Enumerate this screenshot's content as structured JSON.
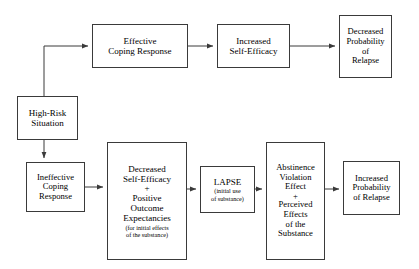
{
  "diagram": {
    "stroke_color": "#3a3a3a",
    "background": "#ffffff",
    "nodes": {
      "high_risk": {
        "lines": [
          "High-Risk",
          "Situation"
        ]
      },
      "effective_coping": {
        "lines": [
          "Effective",
          "Coping Response"
        ]
      },
      "increased_self_efficacy": {
        "lines": [
          "Increased",
          "Self-Efficacy"
        ]
      },
      "decreased_probability_relapse": {
        "lines": [
          "Decreased",
          "Probability",
          "of",
          "Relapse"
        ]
      },
      "ineffective_coping": {
        "lines": [
          "Ineffective",
          "Coping",
          "Response"
        ]
      },
      "decreased_self_efficacy": {
        "lines": [
          "Decreased",
          "Self-Efficacy"
        ],
        "plus": "+",
        "lines2": [
          "Positive",
          "Outcome",
          "Expectancies"
        ],
        "note": [
          "(for initial effects",
          "of the substance)"
        ]
      },
      "lapse": {
        "lines": [
          "LAPSE"
        ],
        "note": [
          "(initial use",
          "of substance)"
        ]
      },
      "abstinence_violation": {
        "lines": [
          "Abstinence",
          "Violation",
          "Effect"
        ],
        "plus": "+",
        "lines2": [
          "Perceived",
          "Effects",
          "of the",
          "Substance"
        ]
      },
      "increased_probability_relapse": {
        "lines": [
          "Increased",
          "Probability",
          "of Relapse"
        ]
      }
    },
    "edges": [
      {
        "name": "high-risk-to-effective-coping",
        "from": "high_risk",
        "to": "effective_coping"
      },
      {
        "name": "effective-coping-to-increased-self-efficacy",
        "from": "effective_coping",
        "to": "increased_self_efficacy"
      },
      {
        "name": "increased-self-efficacy-to-decreased-probability",
        "from": "increased_self_efficacy",
        "to": "decreased_probability_relapse"
      },
      {
        "name": "high-risk-to-ineffective-coping",
        "from": "high_risk",
        "to": "ineffective_coping"
      },
      {
        "name": "ineffective-coping-to-decreased-self-efficacy",
        "from": "ineffective_coping",
        "to": "decreased_self_efficacy"
      },
      {
        "name": "decreased-self-efficacy-to-lapse",
        "from": "decreased_self_efficacy",
        "to": "lapse"
      },
      {
        "name": "lapse-to-abstinence-violation",
        "from": "lapse",
        "to": "abstinence_violation"
      },
      {
        "name": "abstinence-violation-to-increased-probability",
        "from": "abstinence_violation",
        "to": "increased_probability_relapse"
      }
    ]
  }
}
